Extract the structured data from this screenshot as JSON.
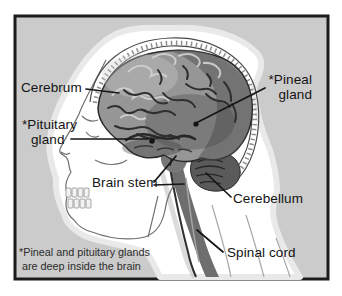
{
  "labels": {
    "cerebrum": "Cerebrum",
    "pineal_line1": "*Pineal",
    "pineal_line2": "gland",
    "pituitary_line1": "*Pituitary",
    "pituitary_line2": "gland",
    "brain_stem": "Brain stem",
    "cerebellum": "Cerebellum",
    "spinal_cord": "Spinal cord"
  },
  "footnote": {
    "line1": "*Pineal and pituitary glands",
    "line2": "are deep inside the brain"
  },
  "colors": {
    "page_background": "#ffffff",
    "panel_background": "#cbcbcb",
    "frame_border": "#1b1b1b",
    "head_silhouette": "#ffffff",
    "silhouette_halo": "#e9e9e9",
    "brain_base": "#969696",
    "brain_sulci": "#2f2f2f",
    "brain_highlight": "#d2d2d2",
    "cerebellum_fill": "#5a5a5a",
    "spinal_cord_fill": "#6e6e6e",
    "skull_line": "#707070",
    "label_text": "#141414",
    "leader_line": "#151515"
  }
}
